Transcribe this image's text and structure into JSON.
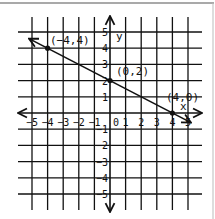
{
  "chart_data": {
    "type": "line",
    "title": "",
    "xlabel": "x",
    "ylabel": "y",
    "xlim": [
      -5,
      5
    ],
    "ylim": [
      -5,
      5
    ],
    "grid": true,
    "x_ticks": [
      "-5",
      "-4",
      "-3",
      "-2",
      "-1",
      "0",
      "1",
      "2",
      "3",
      "4",
      "5"
    ],
    "y_ticks": [
      "5",
      "4",
      "3",
      "2",
      "1",
      "-1",
      "-2",
      "-3",
      "-4",
      "-5"
    ],
    "series": [
      {
        "name": "line",
        "equation": "y = -x/2 + 2",
        "x": [
          -5,
          5
        ],
        "y": [
          4.5,
          -0.5
        ],
        "arrows": "both"
      }
    ],
    "points": [
      {
        "x": -4,
        "y": 4,
        "label": "(-4,4)"
      },
      {
        "x": 0,
        "y": 2,
        "label": "(0,2)"
      },
      {
        "x": 4,
        "y": 0,
        "label": "(4,0)"
      }
    ]
  },
  "labels": {
    "x_axis": "x",
    "y_axis": "y",
    "origin": "0",
    "point_a": "(−4,4)",
    "point_b": "(0,2)",
    "point_c": "(4,0)"
  }
}
